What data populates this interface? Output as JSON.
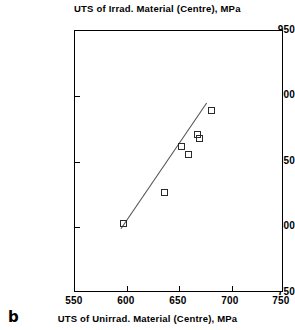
{
  "figure": {
    "panel_label": "b",
    "title": "UTS of Irrad. Material (Centre), MPa",
    "xaxis_title": "UTS of Unirrad. Material (Centre), MPa"
  },
  "chart_data": {
    "type": "scatter",
    "title": "UTS of Irrad. Material (Centre), MPa",
    "xlabel": "UTS of Unirrad. Material (Centre), MPa",
    "ylabel": "UTS of Irrad. Material (Centre), MPa",
    "xlim": [
      550,
      750
    ],
    "ylim": [
      750,
      950
    ],
    "xticks": [
      550,
      600,
      650,
      700,
      750
    ],
    "yticks": [
      750,
      800,
      850,
      900,
      950
    ],
    "xtick_labels": [
      "550",
      "600",
      "650",
      "700",
      "750"
    ],
    "ytick_labels": [
      "750",
      "800",
      "850",
      "900",
      "950"
    ],
    "grid": false,
    "legend": null,
    "marker": "open-square",
    "marker_color": "#2a2a2a",
    "line_color": "#555555",
    "points": [
      {
        "x": 596,
        "y": 803
      },
      {
        "x": 636,
        "y": 827
      },
      {
        "x": 652,
        "y": 862
      },
      {
        "x": 659,
        "y": 856
      },
      {
        "x": 667,
        "y": 871
      },
      {
        "x": 669,
        "y": 868
      },
      {
        "x": 681,
        "y": 889
      }
    ],
    "trend_line": {
      "type": "linear-fit",
      "x_start": 594,
      "y_start": 799,
      "x_end": 676,
      "y_end": 895
    }
  }
}
